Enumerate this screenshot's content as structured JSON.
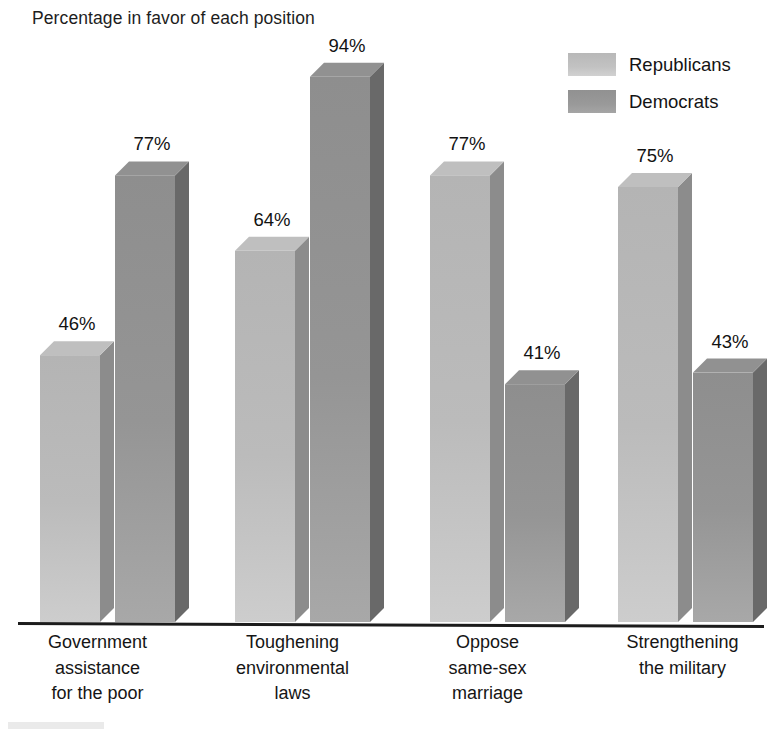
{
  "chart_data": {
    "type": "bar",
    "title": "Percentage in favor of each position",
    "xlabel": "",
    "ylabel": "",
    "ylim": [
      0,
      100
    ],
    "grid": false,
    "legend_position": "top-right",
    "style": "3d-grouped-column",
    "value_suffix": "%",
    "categories": [
      "Government assistance for the poor",
      "Toughening environmental laws",
      "Oppose same-sex marriage",
      "Strengthening the military"
    ],
    "category_lines": [
      [
        "Government",
        "assistance",
        "for the poor"
      ],
      [
        "Toughening",
        "environmental",
        "laws"
      ],
      [
        "Oppose",
        "same-sex",
        "marriage"
      ],
      [
        "Strengthening",
        "the military"
      ]
    ],
    "series": [
      {
        "name": "Republicans",
        "color": "#b4b4b4",
        "values": [
          46,
          64,
          77,
          75
        ],
        "labels": [
          "46%",
          "64%",
          "77%",
          "75%"
        ]
      },
      {
        "name": "Democrats",
        "color": "#8e8e8e",
        "values": [
          77,
          94,
          41,
          43
        ],
        "labels": [
          "77%",
          "94%",
          "41%",
          "43%"
        ]
      }
    ],
    "axis_color": "#1c1c1c"
  },
  "legend": {
    "entries": [
      {
        "label": "Republicans"
      },
      {
        "label": "Democrats"
      }
    ]
  }
}
